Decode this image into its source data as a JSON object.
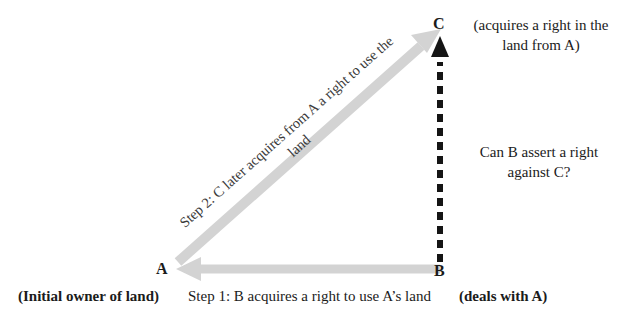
{
  "diagram": {
    "colors": {
      "arrow_gray": "#d3d3d3",
      "arrow_gray_dark": "#c7c7c7",
      "dashed_black": "#151515",
      "text": "#1b1b1b"
    },
    "nodes": [
      {
        "id": "a",
        "label": "A",
        "role": "(Initial owner of land)"
      },
      {
        "id": "b",
        "label": "B",
        "role": "(deals with A)"
      },
      {
        "id": "c",
        "label": "C",
        "role_line1": "(acquires a right in the",
        "role_line2": "land from A)"
      }
    ],
    "edges": {
      "step1": {
        "text": "Step 1: B acquires a right to use A’s land",
        "from": "B",
        "to": "A",
        "style": "solid-gray-block-arrow"
      },
      "step2": {
        "line1": "Step 2: C later acquires from A a right to use the",
        "line2": "land",
        "from": "A",
        "to": "C",
        "style": "solid-gray-block-arrow"
      },
      "question": {
        "line1": "Can B assert a right",
        "line2": "against C?",
        "from": "B",
        "to": "C",
        "style": "thick-dashed-black-arrow"
      }
    }
  }
}
